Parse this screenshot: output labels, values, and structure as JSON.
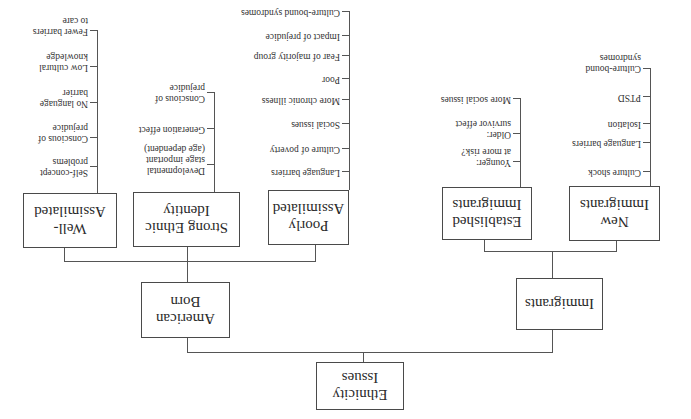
{
  "diagram": {
    "orientation": "rotated-180",
    "root": {
      "label": "Ethnicity Issues",
      "line1": "Ethnicity",
      "line2": "Issues"
    },
    "branches": [
      {
        "label": "Immigrants",
        "children": [
          {
            "label": "New Immigrants",
            "line1": "New",
            "line2": "Immigrants",
            "items": [
              "Culture shock",
              "Language barriers",
              "Isolation",
              "PTSD",
              "Culture-bound syndromes"
            ]
          },
          {
            "label": "Established Immigrants",
            "line1": "Established",
            "line2": "Immigrants",
            "items": [
              "Younger: at more risk?",
              "Older: survivor effect",
              "More social issues"
            ]
          }
        ]
      },
      {
        "label": "American Born",
        "line1": "American",
        "line2": "Born",
        "children": [
          {
            "label": "Poorly Assimilated",
            "line1": "Poorly",
            "line2": "Assimilated",
            "items": [
              "Language barriers",
              "Culture of poverty",
              "Social issues",
              "More chronic illness",
              "Poor",
              "Fear of majority group",
              "Impact of prejudice",
              "Culture-bound syndromes"
            ]
          },
          {
            "label": "Strong Ethnic Identity",
            "line1": "Strong Ethnic",
            "line2": "Identity",
            "items": [
              "Developmental stage important (age dependent)",
              "Generation effect",
              "Conscious of prejudice"
            ]
          },
          {
            "label": "Well-Assimilated",
            "line1": "Well-",
            "line2": "Assimilated",
            "items": [
              "Self-concept problems",
              "Conscious of prejudice",
              "No language barrier",
              "Low cultural knowledge",
              "Fewer barriers to care"
            ]
          }
        ]
      }
    ],
    "leaf_text": {
      "new": [
        "Culture shock",
        "Language barriers",
        "Isolation",
        "PTSD",
        "Culture-bound",
        "syndromes"
      ],
      "established": [
        "Younger:",
        "at more risk?",
        "Older:",
        "survivor effect",
        "More social issues"
      ],
      "poorly": [
        "Language barriers",
        "Culture of poverty",
        "Social issues",
        "More chronic illness",
        "Poor",
        "Fear of majority group",
        "Impact of prejudice",
        "Culture-bound syndromes"
      ],
      "strong": [
        "Developmental",
        "stage important",
        "(age dependent)",
        "Generation effect",
        "Conscious of",
        "prejudice"
      ],
      "well": [
        "Self-concept",
        "problems",
        "Conscious of",
        "prejudice",
        "No language",
        "barrier",
        "Low cultural",
        "knowledge",
        "Fewer barriers",
        "to care"
      ]
    }
  }
}
